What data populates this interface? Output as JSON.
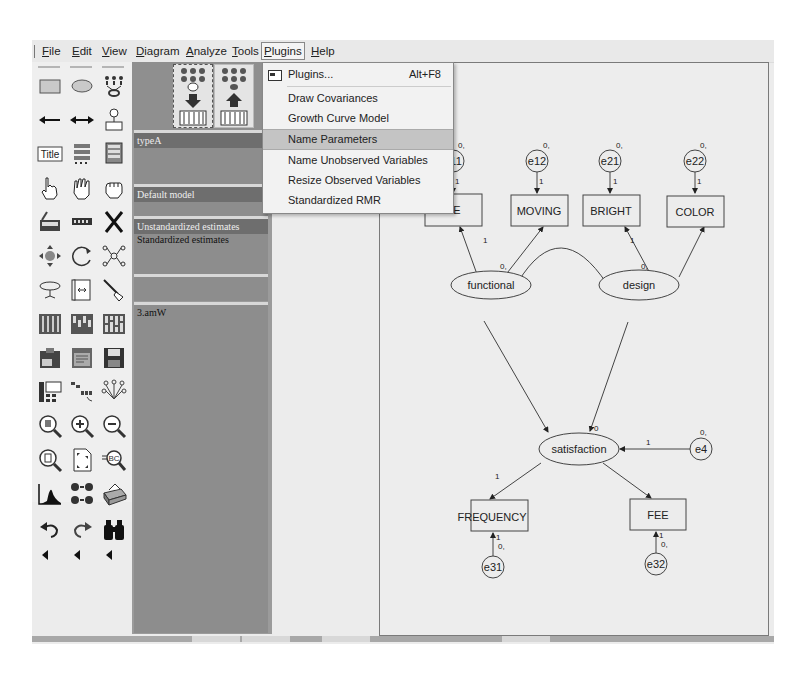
{
  "menubar": {
    "items": [
      {
        "label": "File",
        "ul": "F",
        "rest": "ile"
      },
      {
        "label": "Edit",
        "ul": "E",
        "rest": "dit"
      },
      {
        "label": "View",
        "ul": "V",
        "rest": "iew"
      },
      {
        "label": "Diagram",
        "ul": "D",
        "rest": "iagram"
      },
      {
        "label": "Analyze",
        "ul": "A",
        "rest": "nalyze"
      },
      {
        "label": "Tools",
        "ul": "T",
        "rest": "ools"
      },
      {
        "label": "Plugins",
        "ul": "P",
        "rest": "lugins"
      },
      {
        "label": "Help",
        "ul": "H",
        "rest": "elp"
      }
    ]
  },
  "plugins_menu": {
    "items": [
      {
        "label": "Plugins...",
        "shortcut": "Alt+F8"
      },
      {
        "label": "Draw Covariances"
      },
      {
        "label": "Growth Curve Model"
      },
      {
        "label": "Name Parameters",
        "highlighted": true
      },
      {
        "label": "Name Unobserved Variables"
      },
      {
        "label": "Resize Observed Variables"
      },
      {
        "label": "Standardized RMR"
      }
    ]
  },
  "toolbox": {
    "tools": [
      "draw-observed-variable-icon",
      "draw-unobserved-variable-icon",
      "draw-indicator-variable-icon",
      "draw-path-icon",
      "draw-covariance-icon",
      "add-unique-variable-icon",
      "figure-caption-icon",
      "list-variables-in-model-icon",
      "list-variables-in-dataset-icon",
      "select-one-object-icon",
      "select-all-objects-icon",
      "deselect-all-objects-icon",
      "duplicate-objects-icon",
      "move-objects-icon",
      "erase-objects-icon",
      "change-shape-icon",
      "rotate-indicators-icon",
      "reflect-indicators-icon",
      "move-parameter-values-icon",
      "scroll-diagram-icon",
      "touch-up-icon",
      "select-data-files-icon",
      "analysis-properties-icon",
      "calculate-estimates-icon",
      "copy-to-clipboard-icon",
      "view-text-icon",
      "save-diagram-icon",
      "object-properties-icon",
      "drag-properties-icon",
      "preserve-symmetries-icon",
      "zoom-in-area-icon",
      "zoom-in-icon",
      "zoom-out-icon",
      "zoom-page-icon",
      "fit-to-page-icon",
      "magnifier-icon",
      "bayesian-estimation-icon",
      "multiple-group-analysis-icon",
      "print-icon",
      "undo-icon",
      "redo-icon",
      "specification-search-icon"
    ]
  },
  "model_panel": {
    "groups_header": "typeA",
    "models_header": "Default model",
    "estimates": {
      "header": "Unstandardized estimates",
      "row": "Standardized estimates"
    },
    "file_header": "3.amW"
  },
  "diagram": {
    "observed": [
      {
        "name": "SPACE",
        "display": "PACE"
      },
      {
        "name": "MOVING",
        "display": "MOVING"
      },
      {
        "name": "BRIGHT",
        "display": "BRIGHT"
      },
      {
        "name": "COLOR",
        "display": "COLOR"
      },
      {
        "name": "FREQUENCY",
        "display": "FREQUENCY"
      },
      {
        "name": "FEE",
        "display": "FEE"
      }
    ],
    "latent": [
      "functional",
      "design",
      "satisfaction"
    ],
    "errors": [
      "e11",
      "e12",
      "e21",
      "e22",
      "e4",
      "e31",
      "e32"
    ],
    "param_zero": "0,",
    "param_zero_plain": "0",
    "param_one": "1"
  }
}
